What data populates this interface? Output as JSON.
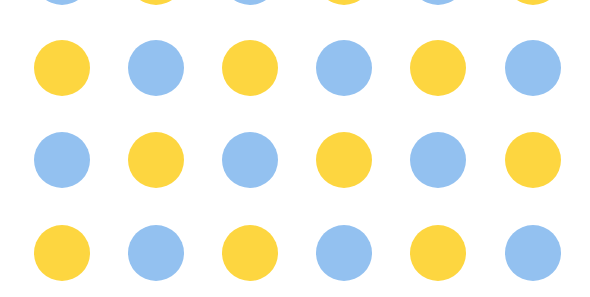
{
  "pattern": {
    "description": "Polka-dot grid of alternating yellow and blue circles on white",
    "colors": {
      "yellow": "#FDD640",
      "blue": "#93C1F0",
      "background": "#FFFFFF"
    },
    "dot_diameter": 56,
    "column_centers_x": [
      62,
      156,
      250,
      344,
      438,
      533
    ],
    "row_centers_y": [
      -23,
      68,
      160,
      253
    ],
    "rows": [
      [
        "blue",
        "yellow",
        "blue",
        "yellow",
        "blue",
        "yellow"
      ],
      [
        "yellow",
        "blue",
        "yellow",
        "blue",
        "yellow",
        "blue"
      ],
      [
        "blue",
        "yellow",
        "blue",
        "yellow",
        "blue",
        "yellow"
      ],
      [
        "yellow",
        "blue",
        "yellow",
        "blue",
        "yellow",
        "blue"
      ]
    ]
  }
}
